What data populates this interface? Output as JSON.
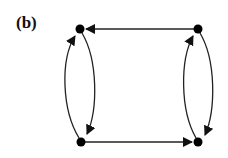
{
  "figure": {
    "label": "(b)",
    "colors": {
      "stroke": "#222222",
      "node": "#000000",
      "background": "#ffffff"
    },
    "nodes": [
      {
        "id": "top-left",
        "x": 80,
        "y": 29
      },
      {
        "id": "top-right",
        "x": 198,
        "y": 29
      },
      {
        "id": "bottom-left",
        "x": 81,
        "y": 142
      },
      {
        "id": "bottom-right",
        "x": 198,
        "y": 142
      }
    ],
    "edges": [
      {
        "from": "top-right",
        "to": "top-left",
        "type": "straight"
      },
      {
        "from": "bottom-left",
        "to": "bottom-right",
        "type": "straight"
      },
      {
        "from": "bottom-left",
        "to": "top-left",
        "type": "curved-left"
      },
      {
        "from": "top-left",
        "to": "bottom-left",
        "type": "curved-right"
      },
      {
        "from": "bottom-right",
        "to": "top-right",
        "type": "curved-left"
      },
      {
        "from": "top-right",
        "to": "bottom-right",
        "type": "curved-right"
      }
    ]
  }
}
